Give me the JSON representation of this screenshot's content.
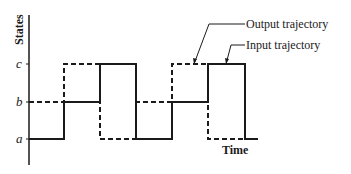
{
  "diagram": {
    "y_axis_label": "States",
    "x_axis_label": "Time",
    "states": [
      {
        "name": "c",
        "y": 64
      },
      {
        "name": "b",
        "y": 102
      },
      {
        "name": "a",
        "y": 139
      }
    ],
    "callouts": {
      "output": "Output trajectory",
      "input": "Input trajectory"
    },
    "input_trajectory": {
      "style": "solid",
      "segments": [
        {
          "state": "a",
          "from": 0,
          "to": 1
        },
        {
          "state": "b",
          "from": 1,
          "to": 2
        },
        {
          "state": "c",
          "from": 2,
          "to": 3
        },
        {
          "state": "a",
          "from": 3,
          "to": 4
        },
        {
          "state": "b",
          "from": 4,
          "to": 5
        },
        {
          "state": "c",
          "from": 5,
          "to": 6
        },
        {
          "state": "a",
          "from": 6,
          "to": 6.35
        }
      ]
    },
    "output_trajectory": {
      "style": "dashed",
      "segments": [
        {
          "state": "b",
          "from": 0,
          "to": 1
        },
        {
          "state": "c",
          "from": 1,
          "to": 2
        },
        {
          "state": "a",
          "from": 2,
          "to": 3
        },
        {
          "state": "b",
          "from": 3,
          "to": 4
        },
        {
          "state": "c",
          "from": 4,
          "to": 5
        },
        {
          "state": "a",
          "from": 5,
          "to": 6
        }
      ]
    },
    "colors": {
      "line": "#1a1a1a",
      "background": "#ffffff"
    }
  }
}
